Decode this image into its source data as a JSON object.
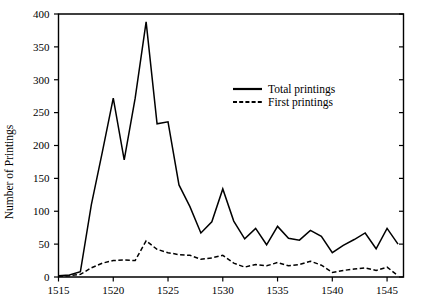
{
  "chart_data": {
    "type": "line",
    "title": "",
    "xlabel": "",
    "ylabel": "Number of Printings",
    "xlim": [
      1515,
      1546.5
    ],
    "ylim": [
      0,
      400
    ],
    "grid": false,
    "legend_position": "upper-right-inside",
    "x_ticks": [
      "1515",
      "1520",
      "1525",
      "1530",
      "1535",
      "1540",
      "1545"
    ],
    "x_tick_values": [
      1515,
      1520,
      1525,
      1530,
      1535,
      1540,
      1545
    ],
    "y_ticks": [
      "0",
      "50",
      "100",
      "150",
      "200",
      "250",
      "300",
      "350",
      "400"
    ],
    "y_tick_values": [
      0,
      50,
      100,
      150,
      200,
      250,
      300,
      350,
      400
    ],
    "x": [
      1515,
      1516,
      1517,
      1518,
      1519,
      1520,
      1521,
      1522,
      1523,
      1524,
      1525,
      1526,
      1527,
      1528,
      1529,
      1530,
      1531,
      1532,
      1533,
      1534,
      1535,
      1536,
      1537,
      1538,
      1539,
      1540,
      1541,
      1542,
      1543,
      1544,
      1545,
      1546
    ],
    "series": [
      {
        "name": "Total printings",
        "style": "solid",
        "color": "#000000",
        "values": [
          2,
          3,
          8,
          110,
          190,
          272,
          178,
          272,
          388,
          233,
          236,
          140,
          107,
          67,
          84,
          134,
          85,
          58,
          74,
          49,
          77,
          59,
          56,
          71,
          62,
          37,
          48,
          57,
          67,
          43,
          74,
          50
        ]
      },
      {
        "name": "First printings",
        "style": "dashed",
        "color": "#000000",
        "values": [
          1,
          2,
          4,
          14,
          21,
          25,
          26,
          25,
          55,
          42,
          37,
          34,
          33,
          27,
          29,
          33,
          21,
          15,
          19,
          17,
          22,
          17,
          19,
          24,
          18,
          7,
          10,
          12,
          14,
          10,
          15,
          2
        ]
      }
    ]
  },
  "legend": {
    "entries": [
      {
        "label": "Total printings",
        "style": "solid"
      },
      {
        "label": "First printings",
        "style": "dashed"
      }
    ]
  },
  "axes": {
    "y_axis_title": "Number of Printings"
  }
}
